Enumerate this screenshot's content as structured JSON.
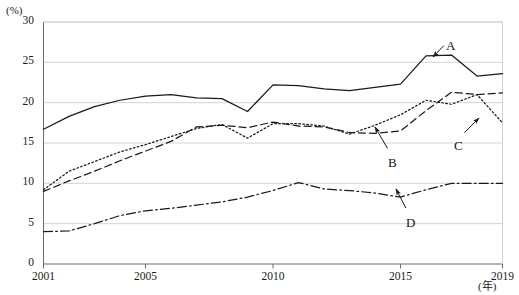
{
  "chart_data": {
    "type": "line",
    "title": "",
    "xlabel": "(年)",
    "ylabel": "(%)",
    "x": [
      2001,
      2002,
      2003,
      2004,
      2005,
      2006,
      2007,
      2008,
      2009,
      2010,
      2011,
      2012,
      2013,
      2014,
      2015,
      2016,
      2017,
      2018,
      2019
    ],
    "xlim": [
      2001,
      2019
    ],
    "ylim": [
      0,
      30
    ],
    "ytick_labels": [
      "0",
      "5",
      "10",
      "15",
      "20",
      "25",
      "30"
    ],
    "ytick_values": [
      0,
      5,
      10,
      15,
      20,
      25,
      30
    ],
    "xtick_labels": [
      "2001",
      "2005",
      "2010",
      "2015",
      "2019"
    ],
    "xtick_values": [
      2001,
      2005,
      2010,
      2015,
      2019
    ],
    "grid": "horizontal",
    "legend_position": "inline-annotations",
    "series": [
      {
        "name": "A",
        "style": "solid",
        "color": "#1a1a1a",
        "values": [
          16.7,
          18.3,
          19.5,
          20.3,
          20.8,
          21.0,
          20.6,
          20.5,
          18.9,
          22.2,
          22.1,
          21.7,
          21.5,
          21.9,
          22.3,
          25.8,
          25.9,
          23.3,
          23.6
        ],
        "label": "A"
      },
      {
        "name": "B",
        "style": "dashed",
        "color": "#1a1a1a",
        "values": [
          9.0,
          10.3,
          11.5,
          12.8,
          14.0,
          15.2,
          17.0,
          17.2,
          16.9,
          17.6,
          17.1,
          17.0,
          16.3,
          16.2,
          16.5,
          19.0,
          21.3,
          21.0,
          21.2
        ],
        "label": "B"
      },
      {
        "name": "C",
        "style": "dotted",
        "color": "#1a1a1a",
        "values": [
          9.2,
          11.5,
          12.7,
          13.9,
          14.8,
          15.8,
          16.8,
          17.3,
          15.6,
          17.4,
          17.4,
          17.1,
          16.1,
          17.2,
          18.5,
          20.3,
          19.8,
          21.0,
          17.5
        ],
        "label": "C"
      },
      {
        "name": "D",
        "style": "dash-dot",
        "color": "#1a1a1a",
        "values": [
          4.0,
          4.1,
          5.0,
          6.0,
          6.6,
          6.9,
          7.3,
          7.7,
          8.3,
          9.1,
          10.1,
          9.3,
          9.1,
          8.8,
          8.3,
          9.2,
          10.0,
          10.0,
          10.0
        ],
        "label": "D"
      }
    ],
    "annotations": [
      {
        "text": "A",
        "label_x": 450,
        "label_y": 39,
        "tip_x": 433,
        "tip_y": 57
      },
      {
        "text": "B",
        "label_x": 392,
        "label_y": 156,
        "tip_x": 375,
        "tip_y": 127
      },
      {
        "text": "C",
        "label_x": 458,
        "label_y": 139,
        "tip_x": 479,
        "tip_y": 118
      },
      {
        "text": "D",
        "label_x": 410,
        "label_y": 216,
        "tip_x": 396,
        "tip_y": 189
      }
    ]
  },
  "axis": {
    "y_unit": "(%)",
    "x_unit": "(年)"
  },
  "colors": {
    "line": "#1a1a1a",
    "grid": "#cfcfcf",
    "axis": "#6b6b6b",
    "text": "#1a1a1a",
    "background": "#ffffff"
  }
}
